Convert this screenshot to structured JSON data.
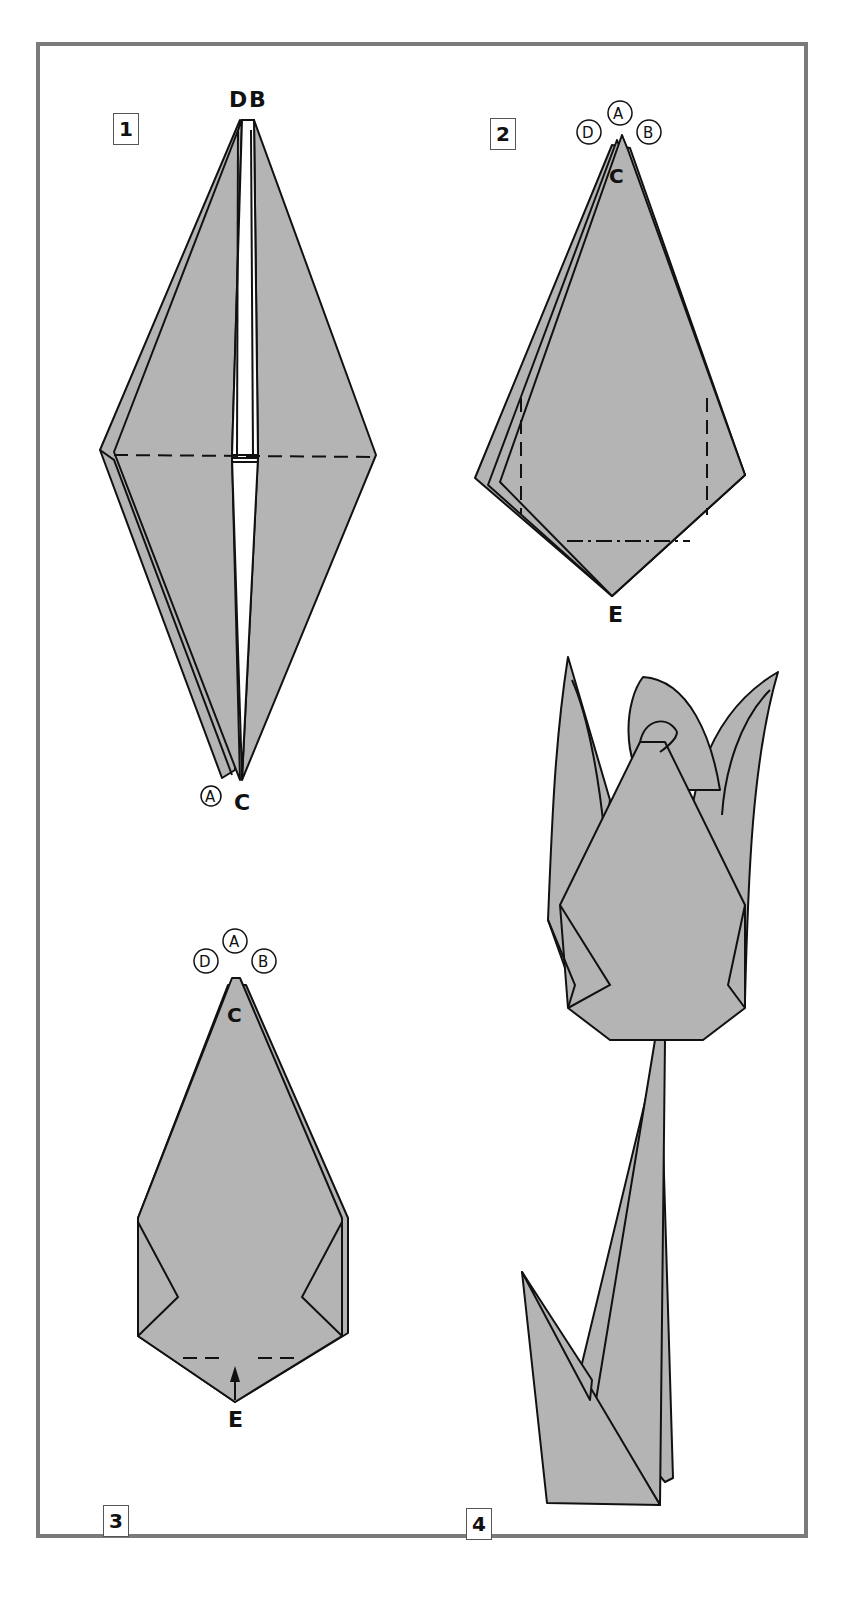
{
  "diagram": {
    "kind": "origami instructions - tulip",
    "colors": {
      "paper": "#b4b4b4",
      "line": "#111111",
      "frame": "#7a7a7a",
      "background": "#ffffff"
    },
    "steps": [
      {
        "number": "1",
        "labels": {
          "top_left": "D",
          "top_right": "B",
          "bottom_circled": "A",
          "bottom": "C"
        },
        "fold_lines": [
          "horizontal valley fold (dashed)"
        ]
      },
      {
        "number": "2",
        "labels": {
          "circled_top": "A",
          "circled_left": "D",
          "circled_right": "B",
          "tip": "C",
          "bottom": "E"
        },
        "fold_lines": [
          "two vertical valley folds (dashed)",
          "horizontal mountain fold (dash-dot)"
        ]
      },
      {
        "number": "3",
        "labels": {
          "circled_top": "A",
          "circled_left": "D",
          "circled_right": "B",
          "tip": "C",
          "bottom": "E"
        },
        "fold_lines": [
          "horizontal valley fold (dashed) with up arrow"
        ]
      },
      {
        "number": "4",
        "labels": {},
        "description": "finished tulip with stem and leaf"
      }
    ]
  }
}
